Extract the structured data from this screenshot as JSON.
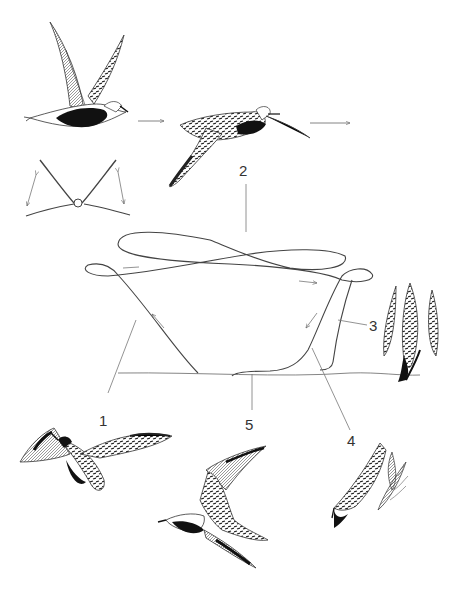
{
  "figure": {
    "type": "flight-display-illustration",
    "colors": {
      "ink": "#222222",
      "line": "#444444",
      "thin": "#666666",
      "background": "#ffffff"
    }
  },
  "labels": {
    "stage_1": "1",
    "stage_2": "2",
    "stage_3": "3",
    "stage_4": "4",
    "stage_5": "5"
  },
  "panels": [
    {
      "id": "bird-takeoff",
      "description": "bird with wings raised, black belly"
    },
    {
      "id": "bird-glide",
      "description": "bird gliding with long bill/tail, spangled upperparts"
    },
    {
      "id": "wingbeat-schematic",
      "description": "front view schematic with up/down wingbeat arrows"
    },
    {
      "id": "flight-path",
      "description": "looping flight path above ground line"
    },
    {
      "id": "bird-climb",
      "description": "bird banking with spread wings (stage 1)"
    },
    {
      "id": "bird-dive-vertical",
      "description": "bird diving vertically (stage 3)"
    },
    {
      "id": "bird-flight-side",
      "description": "bird flying, wings raised"
    },
    {
      "id": "bird-dive-steep",
      "description": "bird in steep dive with motion lines (stage 4)"
    }
  ],
  "caption": {
    "text": ""
  }
}
